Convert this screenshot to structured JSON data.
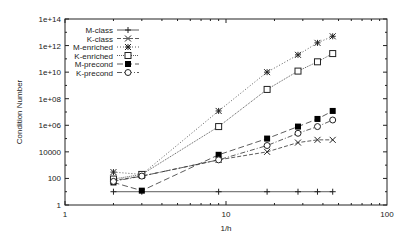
{
  "chart_data": {
    "type": "line",
    "title": "",
    "xlabel": "1/h",
    "ylabel": "Condition Number",
    "xscale": "log",
    "yscale": "log",
    "xlim": [
      1,
      100
    ],
    "ylim": [
      1,
      100000000000000.0
    ],
    "xticks": [
      "1",
      "10",
      "100"
    ],
    "yticks": [
      "1",
      "100",
      "10000",
      "1e+06",
      "1e+08",
      "1e+10",
      "1e+12",
      "1e+14"
    ],
    "legend_position": "top-left",
    "grid": false,
    "x": [
      2,
      3,
      9,
      18,
      28,
      37,
      46
    ],
    "series": [
      {
        "name": "M-class",
        "marker": "+",
        "dash": "solid",
        "values": [
          10,
          10,
          10,
          10,
          10,
          10,
          10
        ]
      },
      {
        "name": "K-class",
        "marker": "x",
        "dash": "4,2",
        "values": [
          70,
          150,
          2500,
          10000,
          50000,
          80000,
          80000
        ]
      },
      {
        "name": "M-enriched",
        "marker": "*",
        "dash": "1,2",
        "values": [
          300,
          200,
          12000000,
          10000000000,
          200000000000,
          1600000000000,
          5000000000000
        ]
      },
      {
        "name": "K-enriched",
        "marker": "square-open",
        "dash": "1,1",
        "values": [
          90,
          200,
          800000,
          500000000,
          12000000000,
          60000000000,
          250000000000
        ]
      },
      {
        "name": "M-precond",
        "marker": "square-filled",
        "dash": "6,3",
        "values": [
          50,
          12,
          6000,
          100000,
          800000,
          3000000,
          12000000
        ]
      },
      {
        "name": "K-precond",
        "marker": "circle-open",
        "dash": "5,2,1,2",
        "values": [
          60,
          150,
          2500,
          30000,
          250000,
          800000,
          2500000
        ]
      }
    ]
  }
}
